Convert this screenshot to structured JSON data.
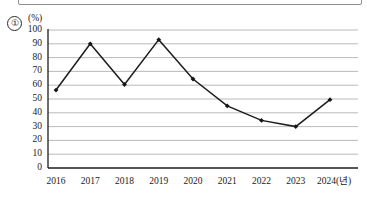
{
  "figure": {
    "item_number": "①",
    "unit_label": "(%)",
    "axis_note": "2024(년)"
  },
  "chart_data": {
    "type": "line",
    "title": "",
    "subtitle": "",
    "xlabel": "2024(년)",
    "ylabel": "(%)",
    "categories": [
      "2016",
      "2017",
      "2018",
      "2019",
      "2020",
      "2021",
      "2022",
      "2023",
      "2024"
    ],
    "x_tick_labels": [
      "2016",
      "2017",
      "2018",
      "2019",
      "2020",
      "2021",
      "2022",
      "2023",
      "2024(년)"
    ],
    "values": [
      56.5,
      90,
      60.5,
      93,
      64.5,
      45,
      34.5,
      30,
      49.5
    ],
    "series": [
      {
        "name": "",
        "values": [
          56.5,
          90,
          60.5,
          93,
          64.5,
          45,
          34.5,
          30,
          49.5
        ],
        "color": "#1d1d1d",
        "marker": "diamond"
      }
    ],
    "ylim": [
      0,
      100
    ],
    "y_ticks": [
      0,
      10,
      20,
      30,
      40,
      50,
      60,
      70,
      80,
      90,
      100
    ],
    "y_tick_labels": [
      "0",
      "10",
      "20",
      "30",
      "40",
      "50",
      "60",
      "70",
      "80",
      "90",
      "100"
    ],
    "grid": true,
    "grid_axis": "y",
    "legend": false,
    "legend_position": "none",
    "annotations": []
  },
  "colors": {
    "line": "#1d1d1d",
    "grid": "#a8a8a8",
    "axis": "#1d1d1d",
    "background": "#ffffff"
  }
}
